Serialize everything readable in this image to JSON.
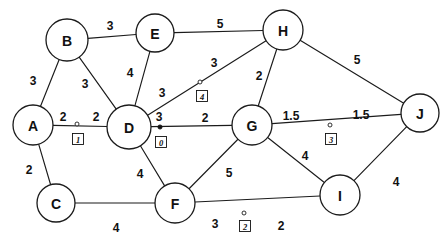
{
  "figure": {
    "background_color": "#ffffff",
    "stroke_color": "#1b1b1b",
    "width": 446,
    "height": 242
  },
  "chart_data": {
    "type": "diagram",
    "title": "",
    "graph_kind": "weighted undirected graph",
    "nodes": [
      {
        "id": "A",
        "label": "A",
        "x": 33,
        "y": 125,
        "r": 20
      },
      {
        "id": "B",
        "label": "B",
        "x": 67,
        "y": 40,
        "r": 21
      },
      {
        "id": "C",
        "label": "C",
        "x": 56,
        "y": 203,
        "r": 19
      },
      {
        "id": "D",
        "label": "D",
        "x": 129,
        "y": 127,
        "r": 22
      },
      {
        "id": "E",
        "label": "E",
        "x": 155,
        "y": 33,
        "r": 19
      },
      {
        "id": "F",
        "label": "F",
        "x": 175,
        "y": 203,
        "r": 20
      },
      {
        "id": "G",
        "label": "G",
        "x": 252,
        "y": 125,
        "r": 20
      },
      {
        "id": "H",
        "label": "H",
        "x": 283,
        "y": 30,
        "r": 20
      },
      {
        "id": "I",
        "label": "I",
        "x": 340,
        "y": 195,
        "r": 20
      },
      {
        "id": "J",
        "label": "J",
        "x": 420,
        "y": 113,
        "r": 19
      }
    ],
    "edges": [
      {
        "source": "B",
        "target": "E",
        "weight": 3,
        "labels": [
          {
            "text": "3",
            "x": 110,
            "y": 26
          }
        ]
      },
      {
        "source": "E",
        "target": "H",
        "weight": 5,
        "labels": [
          {
            "text": "5",
            "x": 220,
            "y": 24
          }
        ]
      },
      {
        "source": "A",
        "target": "B",
        "weight": 3,
        "labels": [
          {
            "text": "3",
            "x": 33,
            "y": 81
          }
        ]
      },
      {
        "source": "B",
        "target": "D",
        "weight": 3,
        "labels": [
          {
            "text": "3",
            "x": 85,
            "y": 84
          }
        ]
      },
      {
        "source": "E",
        "target": "D",
        "weight": 4,
        "labels": [
          {
            "text": "4",
            "x": 130,
            "y": 73
          }
        ]
      },
      {
        "source": "D",
        "target": "H",
        "weight": 6,
        "labels": [
          {
            "text": "3",
            "x": 162,
            "y": 93
          },
          {
            "text": "3",
            "x": 214,
            "y": 63
          }
        ]
      },
      {
        "source": "H",
        "target": "G",
        "weight": 2,
        "labels": [
          {
            "text": "2",
            "x": 259,
            "y": 76
          }
        ]
      },
      {
        "source": "H",
        "target": "J",
        "weight": 5,
        "labels": [
          {
            "text": "5",
            "x": 357,
            "y": 60
          }
        ]
      },
      {
        "source": "A",
        "target": "D",
        "weight": 4,
        "labels": [
          {
            "text": "2",
            "x": 63,
            "y": 117
          },
          {
            "text": "2",
            "x": 96,
            "y": 117
          }
        ]
      },
      {
        "source": "D",
        "target": "G",
        "weight": 5,
        "labels": [
          {
            "text": "3",
            "x": 159,
            "y": 117
          },
          {
            "text": "2",
            "x": 205,
            "y": 118
          }
        ]
      },
      {
        "source": "G",
        "target": "J",
        "weight": 3,
        "labels": [
          {
            "text": "1.5",
            "x": 291,
            "y": 116
          },
          {
            "text": "1.5",
            "x": 361,
            "y": 115
          }
        ]
      },
      {
        "source": "A",
        "target": "C",
        "weight": 2,
        "labels": [
          {
            "text": "2",
            "x": 29,
            "y": 170
          }
        ]
      },
      {
        "source": "D",
        "target": "F",
        "weight": 4,
        "labels": [
          {
            "text": "4",
            "x": 140,
            "y": 174
          }
        ]
      },
      {
        "source": "F",
        "target": "G",
        "weight": 5,
        "labels": [
          {
            "text": "5",
            "x": 229,
            "y": 173
          }
        ]
      },
      {
        "source": "G",
        "target": "I",
        "weight": 4,
        "labels": [
          {
            "text": "4",
            "x": 305,
            "y": 156
          }
        ]
      },
      {
        "source": "C",
        "target": "F",
        "weight": 4,
        "labels": [
          {
            "text": "4",
            "x": 116,
            "y": 228
          }
        ]
      },
      {
        "source": "F",
        "target": "I",
        "weight": 5,
        "labels": [
          {
            "text": "3",
            "x": 215,
            "y": 224
          },
          {
            "text": "2",
            "x": 281,
            "y": 226
          }
        ]
      },
      {
        "source": "I",
        "target": "J",
        "weight": 4,
        "labels": [
          {
            "text": "4",
            "x": 396,
            "y": 182
          }
        ]
      }
    ],
    "markers": [
      {
        "id": "0",
        "label": "0",
        "style": "filled",
        "on_edge": "D-G",
        "x": 160,
        "y": 127,
        "box_x": 161,
        "box_y": 142
      },
      {
        "id": "1",
        "label": "1",
        "style": "open",
        "on_edge": "A-D",
        "x": 77,
        "y": 124,
        "box_x": 78,
        "box_y": 139
      },
      {
        "id": "2",
        "label": "2",
        "style": "open",
        "on_edge": "F-I",
        "x": 244,
        "y": 213,
        "box_x": 245,
        "box_y": 226
      },
      {
        "id": "3",
        "label": "3",
        "style": "open",
        "on_edge": "G-J",
        "x": 330,
        "y": 125,
        "box_x": 331,
        "box_y": 139
      },
      {
        "id": "4",
        "label": "4",
        "style": "open",
        "on_edge": "D-H",
        "x": 200,
        "y": 82,
        "box_x": 202,
        "box_y": 96
      }
    ]
  }
}
